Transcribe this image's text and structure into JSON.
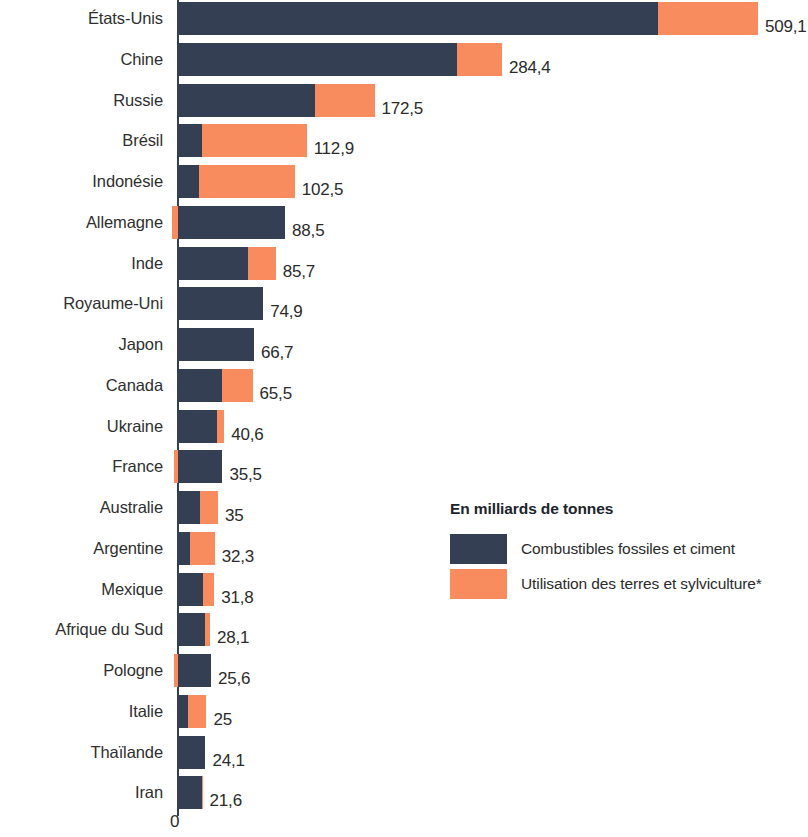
{
  "chart_data": {
    "type": "bar",
    "orientation": "horizontal",
    "stacked": true,
    "title": "",
    "subtitle": "",
    "xlabel": "",
    "ylabel": "",
    "unit_note": "En milliards de tonnes",
    "axis_zero_label": "0",
    "xlim": [
      -10,
      520
    ],
    "grid": false,
    "legend_position": "inside-right",
    "categories": [
      "États-Unis",
      "Chine",
      "Russie",
      "Brésil",
      "Indonésie",
      "Allemagne",
      "Inde",
      "Royaume-Uni",
      "Japon",
      "Canada",
      "Ukraine",
      "France",
      "Australie",
      "Argentine",
      "Mexique",
      "Afrique du Sud",
      "Pologne",
      "Italie",
      "Thaïlande",
      "Iran"
    ],
    "series": [
      {
        "name": "Combustibles fossiles et ciment",
        "color": "#343f54",
        "values": [
          421.0,
          245.0,
          120.5,
          21.0,
          18.5,
          94.0,
          61.5,
          74.9,
          66.7,
          38.5,
          34.0,
          39.0,
          19.5,
          10.5,
          22.0,
          23.5,
          29.0,
          9.0,
          24.1,
          21.0
        ]
      },
      {
        "name": "Utilisation des terres et sylviculture*",
        "color": "#f98c5e",
        "values": [
          88.1,
          39.4,
          52.0,
          91.9,
          84.0,
          -5.5,
          24.2,
          0.0,
          0.0,
          27.0,
          6.6,
          -3.5,
          15.5,
          21.8,
          9.8,
          4.6,
          -3.4,
          16.0,
          0.0,
          0.6
        ]
      }
    ],
    "totals": [
      509.1,
      284.4,
      172.5,
      112.9,
      102.5,
      88.5,
      85.7,
      74.9,
      66.7,
      65.5,
      40.6,
      35.5,
      35,
      32.3,
      31.8,
      28.1,
      25.6,
      25,
      24.1,
      21.6
    ],
    "total_labels": [
      "509,1",
      "284,4",
      "172,5",
      "112,9",
      "102,5",
      "88,5",
      "85,7",
      "74,9",
      "66,7",
      "65,5",
      "40,6",
      "35,5",
      "35",
      "32,3",
      "31,8",
      "28,1",
      "25,6",
      "25",
      "24,1",
      "21,6"
    ]
  },
  "legend": {
    "title": "En milliards de tonnes",
    "items": [
      {
        "label": "Combustibles fossiles et ciment",
        "color": "#343f54"
      },
      {
        "label": "Utilisation des terres et sylviculture*",
        "color": "#f98c5e"
      }
    ]
  },
  "axis": {
    "zero_label": "0"
  }
}
